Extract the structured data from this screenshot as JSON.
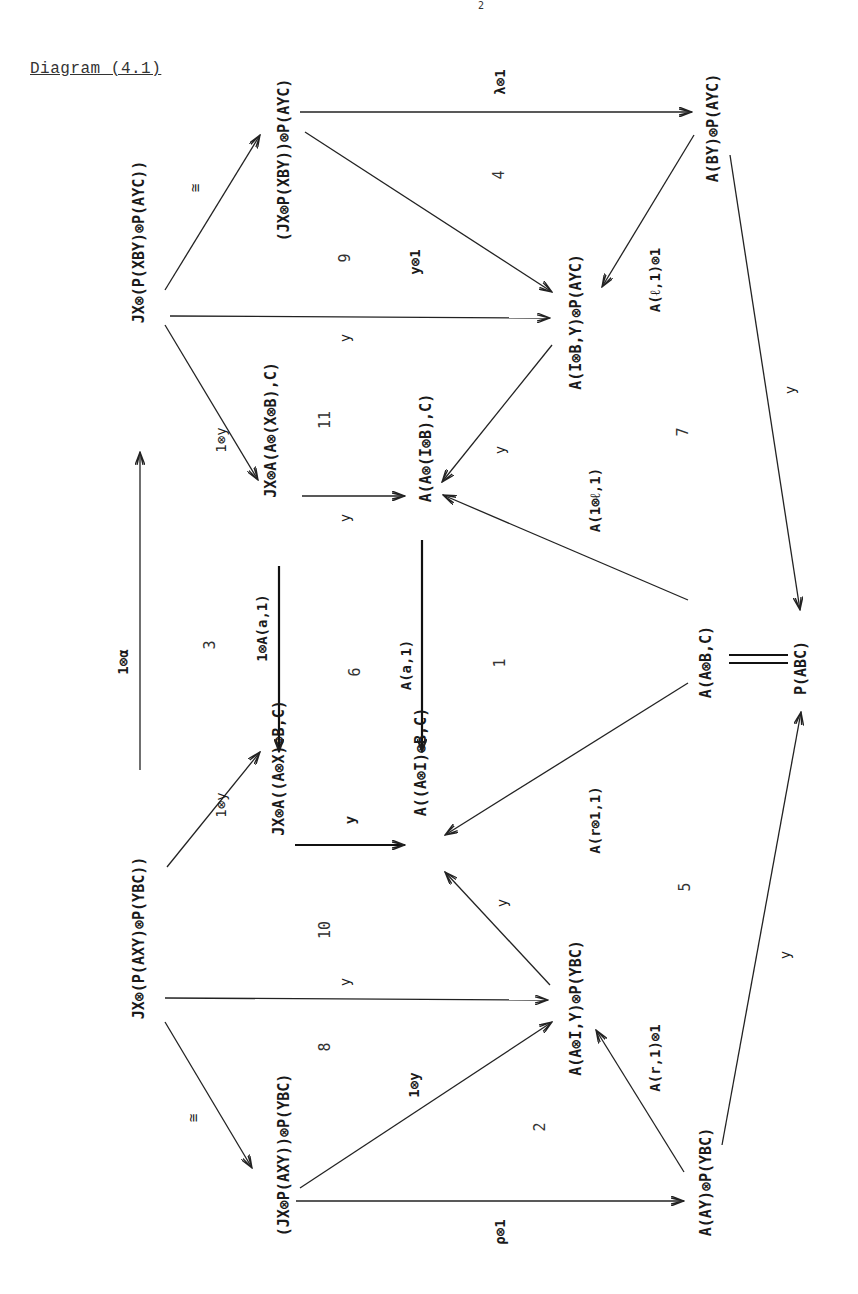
{
  "title": "Diagram (4.1)",
  "page_mark": "2",
  "orientation": "rotated -90deg (text reads bottom-to-top)",
  "nodes": [
    {
      "id": "n1",
      "label": "JX⊗(P(XBY)⊗P(AYC))",
      "x": 138,
      "y": 242
    },
    {
      "id": "n2",
      "label": "(JX⊗P(XBY))⊗P(AYC)",
      "x": 283,
      "y": 160
    },
    {
      "id": "n3",
      "label": "A(BY)⊗P(AYC)",
      "x": 712,
      "y": 128
    },
    {
      "id": "n4",
      "label": "A(I⊗B,Y)⊗P(AYC)",
      "x": 575,
      "y": 322
    },
    {
      "id": "n5",
      "label": "JX⊗A(A⊗(X⊗B),C)",
      "x": 270,
      "y": 430
    },
    {
      "id": "n6",
      "label": "A(A⊗(I⊗B),C)",
      "x": 425,
      "y": 448
    },
    {
      "id": "n7",
      "label": "A(A⊗B,C)",
      "x": 705,
      "y": 662
    },
    {
      "id": "n8",
      "label": "P(ABC)",
      "x": 800,
      "y": 668
    },
    {
      "id": "n9",
      "label": "JX⊗A((A⊗X)⊗B,C)",
      "x": 278,
      "y": 768
    },
    {
      "id": "n10",
      "label": "A((A⊗I)⊗B,C)",
      "x": 420,
      "y": 762
    },
    {
      "id": "n11",
      "label": "JX⊗(P(AXY)⊗P(YBC))",
      "x": 138,
      "y": 938
    },
    {
      "id": "n12",
      "label": "A(A⊗I,Y)⊗P(YBC)",
      "x": 575,
      "y": 1008
    },
    {
      "id": "n13",
      "label": "(JX⊗P(AXY))⊗P(YBC)",
      "x": 283,
      "y": 1155
    },
    {
      "id": "n14",
      "label": "A(AY)⊗P(YBC)",
      "x": 705,
      "y": 1182
    }
  ],
  "edge_labels": {
    "one_tensor_alpha": "1⊗α",
    "iso_top": "≅",
    "iso_bottom": "≅",
    "lambda_tensor_1": "λ⊗1",
    "y_tensor_1": "y⊗1",
    "rho_tensor_1": "ρ⊗1",
    "one_tensor_y_top": "1⊗y",
    "one_tensor_y_bottom": "1⊗y",
    "one_tensor_y_mid": "1⊗y",
    "one_tensor_A_a_1": "1⊗A(a,1)",
    "A_a_1": "A(a,1)",
    "A_l_1_tensor_1": "A(ℓ,1)⊗1",
    "A_r_1_tensor_1": "A(r,1)⊗1",
    "A_1_tensor_l_1": "A(1⊗ℓ,1)",
    "A_r_tensor_1_1": "A(r⊗1,1)",
    "y": "y"
  },
  "regions": [
    "1",
    "2",
    "3",
    "4",
    "5",
    "6",
    "7",
    "8",
    "9",
    "10",
    "11"
  ],
  "equality": "="
}
